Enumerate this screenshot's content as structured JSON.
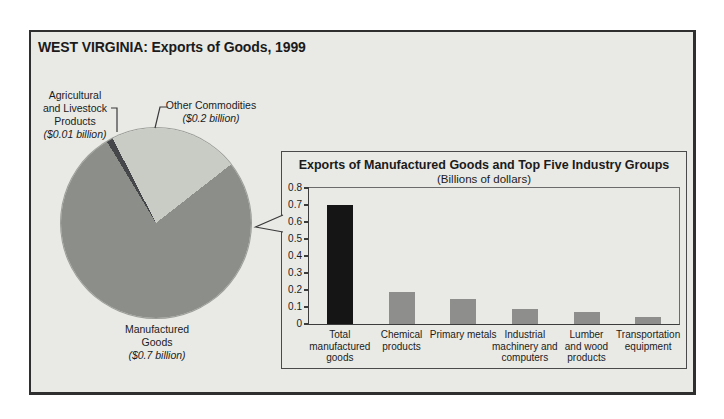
{
  "figure": {
    "title": "WEST VIRGINIA: Exports of Goods, 1999",
    "background_color": "#e9eae6",
    "frame_border_color": "#2f2f2f"
  },
  "chart_data": [
    {
      "type": "pie",
      "labels": [
        "Manufactured Goods",
        "Agricultural and Livestock Products",
        "Other Commodities"
      ],
      "values": [
        0.7,
        0.01,
        0.2
      ],
      "value_labels": [
        "($0.7 billion)",
        "($0.01 billion)",
        "($0.2 billion)"
      ],
      "display_labels": [
        "Manufactured\nGoods",
        "Agricultural\nand Livestock\nProducts",
        "Other Commodities"
      ],
      "colors": [
        "#8c8e8a",
        "#46474a",
        "#c9cbc5"
      ],
      "units": "billions of dollars",
      "start_angle_deg": 52,
      "legend": "labels with leader lines around pie"
    },
    {
      "type": "bar",
      "title": "Exports of Manufactured Goods and Top Five Industry Groups",
      "subtitle": "(Billions of dollars)",
      "categories": [
        "Total\nmanufactured\ngoods",
        "Chemical\nproducts",
        "Primary metals",
        "Industrial\nmachinery and\ncomputers",
        "Lumber\nand wood\nproducts",
        "Transportation\nequipment"
      ],
      "values": [
        0.7,
        0.19,
        0.15,
        0.09,
        0.07,
        0.04
      ],
      "bar_colors": [
        "#151515",
        "#8e8f8d",
        "#8e8f8d",
        "#8e8f8d",
        "#8e8f8d",
        "#8e8f8d"
      ],
      "xlabel": "",
      "ylabel": "",
      "ylim": [
        0,
        0.8
      ],
      "yticks": [
        "0.8",
        "0.7",
        "0.6",
        "0.5",
        "0.4",
        "0.3",
        "0.2",
        "0.1",
        "0"
      ],
      "grid": "off",
      "plot_box": "closed box with left tick marks"
    }
  ]
}
